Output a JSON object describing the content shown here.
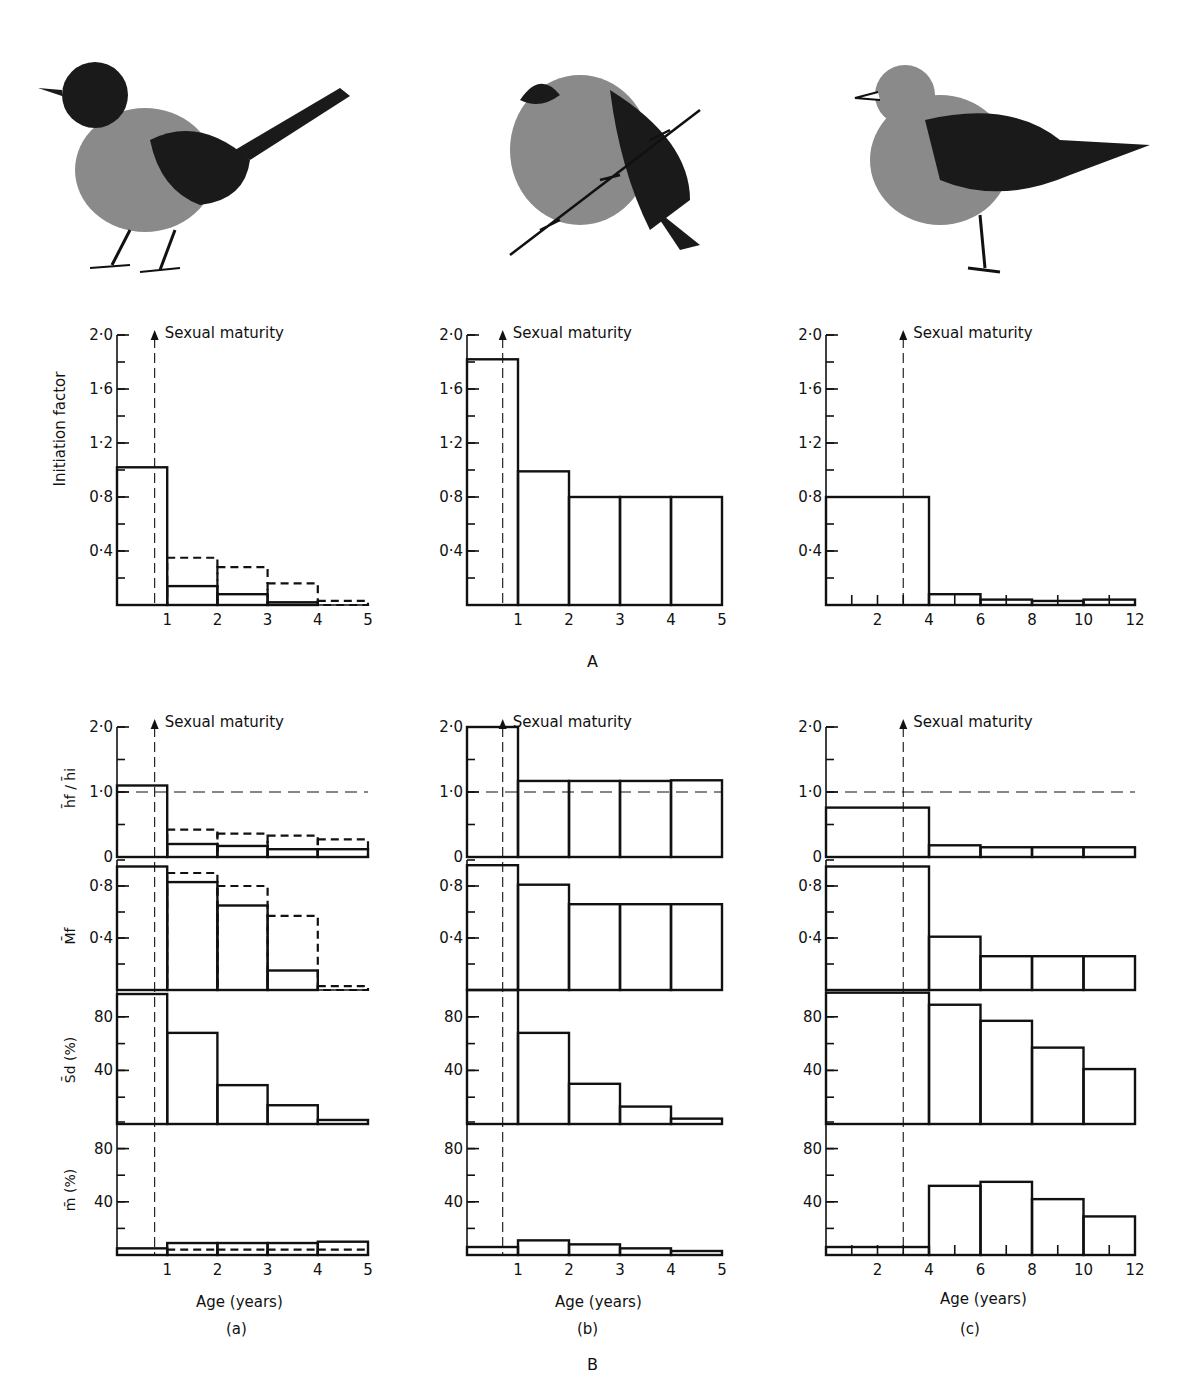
{
  "figure": {
    "section_labels": {
      "A": "A",
      "B": "B"
    },
    "column_labels": [
      "(a)",
      "(b)",
      "(c)"
    ],
    "birds": [
      {
        "column": "a",
        "description": "small passerine with dark head and long tail"
      },
      {
        "column": "b",
        "description": "small round bird perched on conifer branch"
      },
      {
        "column": "c",
        "description": "gull standing"
      }
    ],
    "maturity_label": "Sexual maturity",
    "xlabel": "Age (years)",
    "ylabels": {
      "initiation": "Initiation factor",
      "h": "h̄f / h̄i",
      "M": "M̄f",
      "Sd": "S̄d (%)",
      "m": "m̄ (%)"
    }
  },
  "chart_data": [
    {
      "id": "A-a",
      "type": "bar",
      "section": "A",
      "column": "a",
      "title": "",
      "ylabel": "Initiation factor",
      "xlabel": "",
      "x_ticks": [
        "1",
        "2",
        "3",
        "4",
        "5"
      ],
      "y_ticks": [
        "0.4",
        "0.8",
        "1.2",
        "1.6",
        "2.0"
      ],
      "ylim": [
        0,
        2.0
      ],
      "xlim": [
        0,
        5
      ],
      "sexual_maturity_age": 0.75,
      "bins": [
        [
          0,
          1
        ],
        [
          1,
          2
        ],
        [
          2,
          3
        ],
        [
          3,
          4
        ],
        [
          4,
          5
        ]
      ],
      "series": [
        {
          "name": "solid",
          "style": "solid",
          "values": [
            1.02,
            0.14,
            0.08,
            0.02,
            0.0
          ]
        },
        {
          "name": "dashed",
          "style": "dashed",
          "values": [
            1.02,
            0.35,
            0.28,
            0.16,
            0.03
          ]
        }
      ]
    },
    {
      "id": "A-b",
      "type": "bar",
      "section": "A",
      "column": "b",
      "ylabel": "",
      "x_ticks": [
        "1",
        "2",
        "3",
        "4",
        "5"
      ],
      "y_ticks": [
        "0.4",
        "0.8",
        "1.2",
        "1.6",
        "2.0"
      ],
      "ylim": [
        0,
        2.0
      ],
      "xlim": [
        0,
        5
      ],
      "sexual_maturity_age": 0.7,
      "bins": [
        [
          0,
          1
        ],
        [
          1,
          2
        ],
        [
          2,
          3
        ],
        [
          3,
          4
        ],
        [
          4,
          5
        ]
      ],
      "series": [
        {
          "name": "solid",
          "style": "solid",
          "values": [
            1.82,
            0.99,
            0.8,
            0.8,
            0.8
          ]
        }
      ]
    },
    {
      "id": "A-c",
      "type": "bar",
      "section": "A",
      "column": "c",
      "ylabel": "",
      "x_ticks": [
        "2",
        "4",
        "6",
        "8",
        "10",
        "12"
      ],
      "y_ticks": [
        "0.4",
        "0.8",
        "1.2",
        "1.6",
        "2.0"
      ],
      "ylim": [
        0,
        2.0
      ],
      "xlim": [
        0,
        12
      ],
      "sexual_maturity_age": 3,
      "bins": [
        [
          0,
          4
        ],
        [
          4,
          6
        ],
        [
          6,
          8
        ],
        [
          8,
          10
        ],
        [
          10,
          12
        ]
      ],
      "series": [
        {
          "name": "solid",
          "style": "solid",
          "values": [
            0.8,
            0.08,
            0.04,
            0.03,
            0.04
          ]
        }
      ]
    },
    {
      "id": "B-a-h",
      "type": "bar",
      "section": "B",
      "column": "a",
      "ylabel": "h̄f / h̄i",
      "y_ticks": [
        "0",
        "1.0",
        "2.0"
      ],
      "ylim": [
        0,
        2.0
      ],
      "xlim": [
        0,
        5
      ],
      "reference_line": 1.0,
      "sexual_maturity_age": 0.75,
      "bins": [
        [
          0,
          1
        ],
        [
          1,
          2
        ],
        [
          2,
          3
        ],
        [
          3,
          4
        ],
        [
          4,
          5
        ]
      ],
      "series": [
        {
          "name": "solid",
          "style": "solid",
          "values": [
            1.1,
            0.2,
            0.17,
            0.12,
            0.12
          ]
        },
        {
          "name": "dashed",
          "style": "dashed",
          "values": [
            1.1,
            0.42,
            0.36,
            0.33,
            0.27
          ]
        }
      ]
    },
    {
      "id": "B-a-M",
      "type": "bar",
      "section": "B",
      "column": "a",
      "ylabel": "M̄f",
      "y_ticks": [
        "0.4",
        "0.8"
      ],
      "ylim": [
        0,
        1.0
      ],
      "xlim": [
        0,
        5
      ],
      "bins": [
        [
          0,
          1
        ],
        [
          1,
          2
        ],
        [
          2,
          3
        ],
        [
          3,
          4
        ],
        [
          4,
          5
        ]
      ],
      "series": [
        {
          "name": "solid",
          "style": "solid",
          "values": [
            0.95,
            0.83,
            0.65,
            0.15,
            0.0
          ]
        },
        {
          "name": "dashed",
          "style": "dashed",
          "values": [
            0.95,
            0.9,
            0.8,
            0.57,
            0.03
          ]
        }
      ]
    },
    {
      "id": "B-a-Sd",
      "type": "bar",
      "section": "B",
      "column": "a",
      "ylabel": "S̄d (%)",
      "y_ticks": [
        "40",
        "80"
      ],
      "ylim": [
        0,
        100
      ],
      "xlim": [
        0,
        5
      ],
      "bins": [
        [
          0,
          1
        ],
        [
          1,
          2
        ],
        [
          2,
          3
        ],
        [
          3,
          4
        ],
        [
          4,
          5
        ]
      ],
      "series": [
        {
          "name": "solid",
          "style": "solid",
          "values": [
            97,
            68,
            29,
            14,
            3
          ]
        }
      ]
    },
    {
      "id": "B-a-m",
      "type": "bar",
      "section": "B",
      "column": "a",
      "ylabel": "m̄ (%)",
      "xlabel": "Age (years)",
      "x_ticks": [
        "1",
        "2",
        "3",
        "4",
        "5"
      ],
      "y_ticks": [
        "40",
        "80"
      ],
      "ylim": [
        0,
        100
      ],
      "xlim": [
        0,
        5
      ],
      "bins": [
        [
          0,
          1
        ],
        [
          1,
          2
        ],
        [
          2,
          3
        ],
        [
          3,
          4
        ],
        [
          4,
          5
        ]
      ],
      "series": [
        {
          "name": "solid",
          "style": "solid",
          "values": [
            5,
            9,
            9,
            9,
            10
          ]
        },
        {
          "name": "dashed",
          "style": "dashed",
          "values": [
            5,
            4,
            4,
            4,
            4
          ]
        }
      ]
    },
    {
      "id": "B-b-h",
      "type": "bar",
      "section": "B",
      "column": "b",
      "y_ticks": [
        "0",
        "1.0",
        "2.0"
      ],
      "ylim": [
        0,
        2.0
      ],
      "xlim": [
        0,
        5
      ],
      "reference_line": 1.0,
      "sexual_maturity_age": 0.7,
      "bins": [
        [
          0,
          1
        ],
        [
          1,
          2
        ],
        [
          2,
          3
        ],
        [
          3,
          4
        ],
        [
          4,
          5
        ]
      ],
      "series": [
        {
          "name": "solid",
          "style": "solid",
          "values": [
            2.0,
            1.17,
            1.17,
            1.17,
            1.18
          ]
        }
      ]
    },
    {
      "id": "B-b-M",
      "type": "bar",
      "section": "B",
      "column": "b",
      "y_ticks": [
        "0.4",
        "0.8"
      ],
      "ylim": [
        0,
        1.0
      ],
      "xlim": [
        0,
        5
      ],
      "bins": [
        [
          0,
          1
        ],
        [
          1,
          2
        ],
        [
          2,
          3
        ],
        [
          3,
          4
        ],
        [
          4,
          5
        ]
      ],
      "series": [
        {
          "name": "solid",
          "style": "solid",
          "values": [
            0.96,
            0.81,
            0.66,
            0.66,
            0.66
          ]
        }
      ]
    },
    {
      "id": "B-b-Sd",
      "type": "bar",
      "section": "B",
      "column": "b",
      "y_ticks": [
        "40",
        "80"
      ],
      "ylim": [
        0,
        100
      ],
      "xlim": [
        0,
        5
      ],
      "bins": [
        [
          0,
          1
        ],
        [
          1,
          2
        ],
        [
          2,
          3
        ],
        [
          3,
          4
        ],
        [
          4,
          5
        ]
      ],
      "series": [
        {
          "name": "solid",
          "style": "solid",
          "values": [
            100,
            68,
            30,
            13,
            4
          ]
        }
      ]
    },
    {
      "id": "B-b-m",
      "type": "bar",
      "section": "B",
      "column": "b",
      "xlabel": "Age (years)",
      "x_ticks": [
        "1",
        "2",
        "3",
        "4",
        "5"
      ],
      "y_ticks": [
        "40",
        "80"
      ],
      "ylim": [
        0,
        100
      ],
      "xlim": [
        0,
        5
      ],
      "bins": [
        [
          0,
          1
        ],
        [
          1,
          2
        ],
        [
          2,
          3
        ],
        [
          3,
          4
        ],
        [
          4,
          5
        ]
      ],
      "series": [
        {
          "name": "solid",
          "style": "solid",
          "values": [
            6,
            11,
            8,
            5,
            3
          ]
        }
      ]
    },
    {
      "id": "B-c-h",
      "type": "bar",
      "section": "B",
      "column": "c",
      "y_ticks": [
        "0",
        "1.0",
        "2.0"
      ],
      "ylim": [
        0,
        2.0
      ],
      "xlim": [
        0,
        12
      ],
      "reference_line": 1.0,
      "sexual_maturity_age": 3,
      "bins": [
        [
          0,
          4
        ],
        [
          4,
          6
        ],
        [
          6,
          8
        ],
        [
          8,
          10
        ],
        [
          10,
          12
        ]
      ],
      "series": [
        {
          "name": "solid",
          "style": "solid",
          "values": [
            0.76,
            0.18,
            0.15,
            0.15,
            0.15
          ]
        }
      ]
    },
    {
      "id": "B-c-M",
      "type": "bar",
      "section": "B",
      "column": "c",
      "y_ticks": [
        "0.4",
        "0.8"
      ],
      "ylim": [
        0,
        1.0
      ],
      "xlim": [
        0,
        12
      ],
      "bins": [
        [
          0,
          4
        ],
        [
          4,
          6
        ],
        [
          6,
          8
        ],
        [
          8,
          10
        ],
        [
          10,
          12
        ]
      ],
      "series": [
        {
          "name": "solid",
          "style": "solid",
          "values": [
            0.95,
            0.41,
            0.26,
            0.26,
            0.26
          ]
        }
      ]
    },
    {
      "id": "B-c-Sd",
      "type": "bar",
      "section": "B",
      "column": "c",
      "y_ticks": [
        "40",
        "80"
      ],
      "ylim": [
        0,
        100
      ],
      "xlim": [
        0,
        12
      ],
      "bins": [
        [
          0,
          4
        ],
        [
          4,
          6
        ],
        [
          6,
          8
        ],
        [
          8,
          10
        ],
        [
          10,
          12
        ]
      ],
      "series": [
        {
          "name": "solid",
          "style": "solid",
          "values": [
            98,
            89,
            77,
            57,
            41
          ]
        }
      ]
    },
    {
      "id": "B-c-m",
      "type": "bar",
      "section": "B",
      "column": "c",
      "xlabel": "Age (years)",
      "x_ticks": [
        "2",
        "4",
        "6",
        "8",
        "10",
        "12"
      ],
      "y_ticks": [
        "40",
        "80"
      ],
      "ylim": [
        0,
        100
      ],
      "xlim": [
        0,
        12
      ],
      "bins": [
        [
          0,
          4
        ],
        [
          4,
          6
        ],
        [
          6,
          8
        ],
        [
          8,
          10
        ],
        [
          10,
          12
        ]
      ],
      "series": [
        {
          "name": "solid",
          "style": "solid",
          "values": [
            6,
            52,
            55,
            42,
            29
          ]
        }
      ]
    }
  ]
}
